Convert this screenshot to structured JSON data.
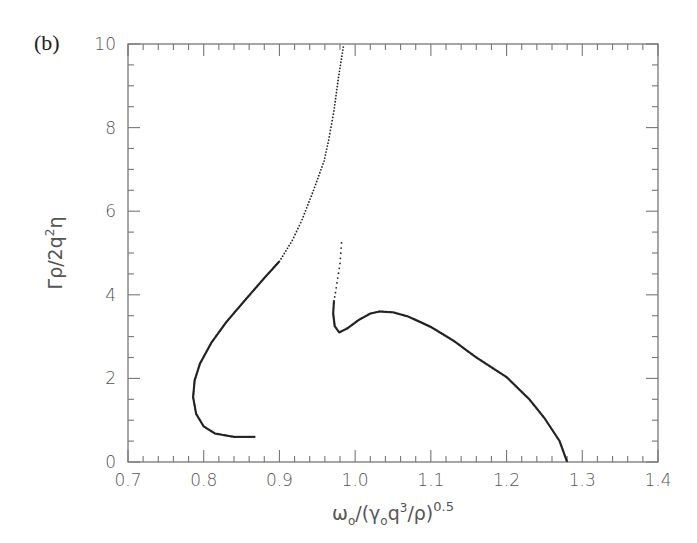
{
  "panel_label": "(b)",
  "chart_data": {
    "type": "scatter",
    "title": "",
    "xlabel": "ω₀/(γ₀q³/ρ)^0.5",
    "ylabel": "Γρ/2q²η",
    "xlim": [
      0.7,
      1.4
    ],
    "ylim": [
      0,
      10
    ],
    "x_ticks": [
      0.7,
      0.8,
      0.9,
      1.0,
      1.1,
      1.2,
      1.3,
      1.4
    ],
    "x_tick_labels": [
      "0.7",
      "0.8",
      "0.9",
      "1.0",
      "1.1",
      "1.2",
      "1.3",
      "1.4"
    ],
    "y_ticks": [
      0,
      2,
      4,
      6,
      8,
      10
    ],
    "y_tick_labels": [
      "0",
      "2",
      "4",
      "6",
      "8",
      "10"
    ],
    "grid": false,
    "legend": null,
    "series": [
      {
        "name": "branch-1 (solid lower part, dotted upper part)",
        "style": "dense-dots",
        "x": [
          0.867,
          0.84,
          0.815,
          0.8,
          0.79,
          0.786,
          0.788,
          0.795,
          0.81,
          0.83,
          0.856,
          0.88,
          0.9,
          0.917,
          0.93,
          0.945,
          0.959,
          0.965,
          0.972,
          0.978,
          0.985
        ],
        "y": [
          0.6,
          0.6,
          0.68,
          0.85,
          1.15,
          1.55,
          1.95,
          2.35,
          2.85,
          3.35,
          3.9,
          4.4,
          4.8,
          5.3,
          5.8,
          6.5,
          7.2,
          7.7,
          8.4,
          9.2,
          10.0
        ]
      },
      {
        "name": "branch-2",
        "style": "dense-dots",
        "x": [
          0.982,
          0.98,
          0.977,
          0.974,
          0.972,
          0.971,
          0.973,
          0.979,
          0.99,
          1.005,
          1.02,
          1.032,
          1.05,
          1.07,
          1.1,
          1.13,
          1.16,
          1.2,
          1.23,
          1.25,
          1.27,
          1.28
        ],
        "y": [
          5.24,
          4.75,
          4.4,
          4.05,
          3.85,
          3.55,
          3.25,
          3.1,
          3.2,
          3.4,
          3.55,
          3.6,
          3.58,
          3.48,
          3.23,
          2.9,
          2.5,
          2.03,
          1.5,
          1.05,
          0.5,
          0.0
        ]
      }
    ]
  }
}
